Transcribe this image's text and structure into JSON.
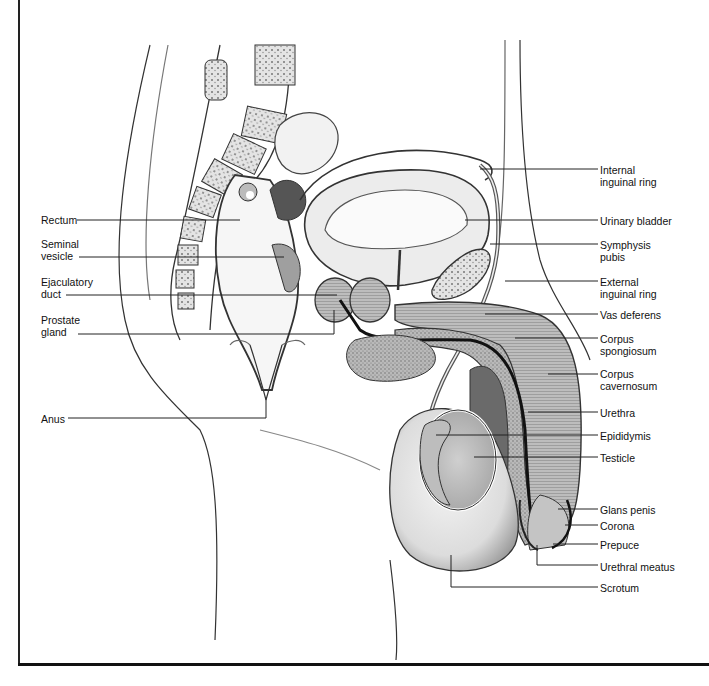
{
  "diagram": {
    "type": "anatomical-illustration",
    "colors": {
      "line": "#222222",
      "shade_dark": "#6a6a6a",
      "shade_mid": "#a8a8a8",
      "shade_light": "#d9d9d9",
      "background": "#ffffff"
    }
  },
  "labels_left": [
    {
      "id": "rectum",
      "lines": [
        "Rectum"
      ],
      "x": 41,
      "y": 214,
      "leader": [
        [
          77,
          220
        ],
        [
          240,
          220
        ]
      ]
    },
    {
      "id": "seminal-vesicle",
      "lines": [
        "Seminal",
        "vesicle"
      ],
      "x": 41,
      "y": 238,
      "leader": [
        [
          79,
          257
        ],
        [
          284,
          257
        ]
      ]
    },
    {
      "id": "ejaculatory-duct",
      "lines": [
        "Ejaculatory",
        "duct"
      ],
      "x": 41,
      "y": 276,
      "leader": [
        [
          66,
          295
        ],
        [
          337,
          295
        ]
      ]
    },
    {
      "id": "prostate-gland",
      "lines": [
        "Prostate",
        "gland"
      ],
      "x": 41,
      "y": 314,
      "leader": [
        [
          78,
          334
        ],
        [
          334,
          334
        ],
        [
          334,
          310
        ]
      ]
    },
    {
      "id": "anus",
      "lines": [
        "Anus"
      ],
      "x": 41,
      "y": 413,
      "leader": [
        [
          68,
          418
        ],
        [
          266,
          418
        ],
        [
          266,
          400
        ]
      ]
    }
  ],
  "labels_right": [
    {
      "id": "internal-inguinal-ring",
      "lines": [
        "Internal",
        "inguinal ring"
      ],
      "x": 600,
      "y": 164,
      "leader": [
        [
          480,
          169
        ],
        [
          598,
          169
        ]
      ]
    },
    {
      "id": "urinary-bladder",
      "lines": [
        "Urinary bladder"
      ],
      "x": 600,
      "y": 215,
      "leader": [
        [
          465,
          220
        ],
        [
          598,
          220
        ]
      ]
    },
    {
      "id": "symphysis-pubis",
      "lines": [
        "Symphysis",
        "pubis"
      ],
      "x": 600,
      "y": 239,
      "leader": [
        [
          490,
          244
        ],
        [
          598,
          244
        ]
      ]
    },
    {
      "id": "external-inguinal-ring",
      "lines": [
        "External",
        "inguinal ring"
      ],
      "x": 600,
      "y": 276,
      "leader": [
        [
          505,
          281
        ],
        [
          598,
          281
        ]
      ]
    },
    {
      "id": "vas-deferens",
      "lines": [
        "Vas deferens"
      ],
      "x": 600,
      "y": 309,
      "leader": [
        [
          485,
          314
        ],
        [
          598,
          314
        ]
      ]
    },
    {
      "id": "corpus-spongiosum",
      "lines": [
        "Corpus",
        "spongiosum"
      ],
      "x": 600,
      "y": 333,
      "leader": [
        [
          515,
          338
        ],
        [
          598,
          338
        ]
      ]
    },
    {
      "id": "corpus-cavernosum",
      "lines": [
        "Corpus",
        "cavernosum"
      ],
      "x": 600,
      "y": 368,
      "leader": [
        [
          548,
          374
        ],
        [
          598,
          374
        ]
      ]
    },
    {
      "id": "urethra",
      "lines": [
        "Urethra"
      ],
      "x": 600,
      "y": 407,
      "leader": [
        [
          528,
          412
        ],
        [
          598,
          412
        ]
      ]
    },
    {
      "id": "epididymis",
      "lines": [
        "Epididymis"
      ],
      "x": 600,
      "y": 430,
      "leader": [
        [
          436,
          435
        ],
        [
          598,
          435
        ]
      ]
    },
    {
      "id": "testicle",
      "lines": [
        "Testicle"
      ],
      "x": 600,
      "y": 452,
      "leader": [
        [
          474,
          457
        ],
        [
          598,
          457
        ]
      ]
    },
    {
      "id": "glans-penis",
      "lines": [
        "Glans penis"
      ],
      "x": 600,
      "y": 504,
      "leader": [
        [
          558,
          509
        ],
        [
          598,
          509
        ]
      ]
    },
    {
      "id": "corona",
      "lines": [
        "Corona"
      ],
      "x": 600,
      "y": 520,
      "leader": [
        [
          565,
          525
        ],
        [
          598,
          525
        ]
      ]
    },
    {
      "id": "prepuce",
      "lines": [
        "Prepuce"
      ],
      "x": 600,
      "y": 539,
      "leader": [
        [
          553,
          544
        ],
        [
          598,
          544
        ]
      ]
    },
    {
      "id": "urethral-meatus",
      "lines": [
        "Urethral meatus"
      ],
      "x": 600,
      "y": 561,
      "leader": [
        [
          537,
          545
        ],
        [
          537,
          565
        ],
        [
          598,
          565
        ]
      ]
    },
    {
      "id": "scrotum",
      "lines": [
        "Scrotum"
      ],
      "x": 600,
      "y": 582,
      "leader": [
        [
          451,
          555
        ],
        [
          451,
          587
        ],
        [
          598,
          587
        ]
      ]
    }
  ]
}
